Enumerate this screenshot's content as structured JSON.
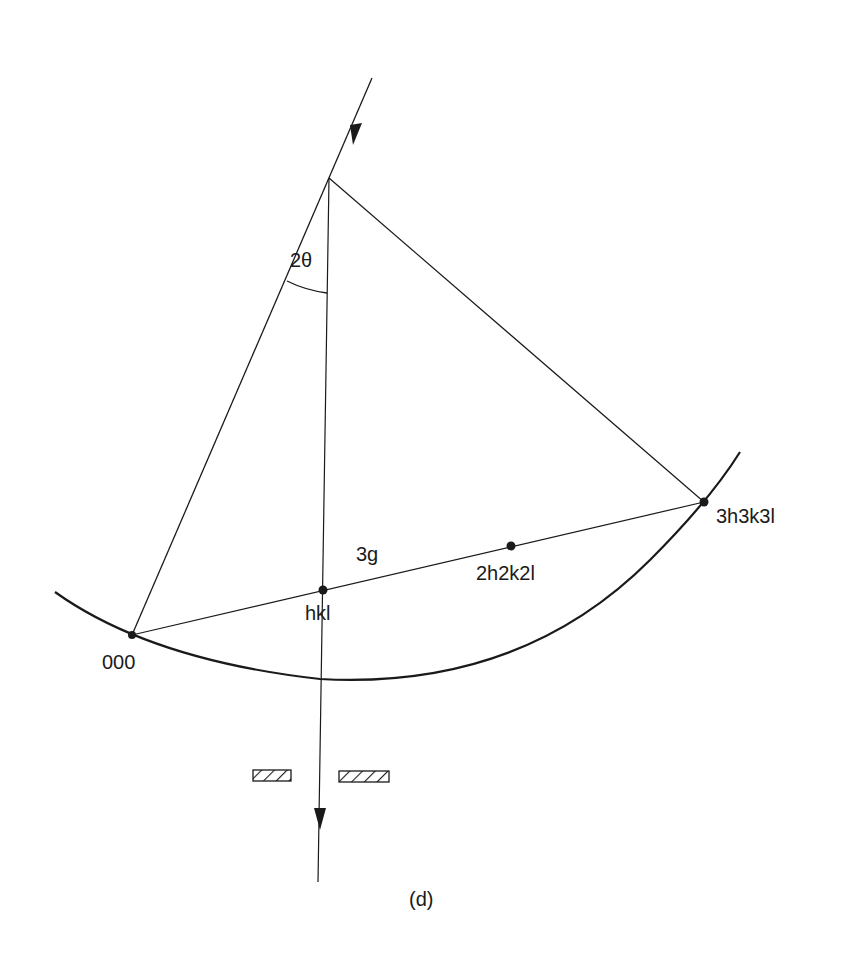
{
  "figure": {
    "caption": "(d)",
    "colors": {
      "ink": "#1a1a1a",
      "background": "#ffffff"
    }
  },
  "labels": {
    "angle": "2θ",
    "origin": "000",
    "first_point": "hkl",
    "second_point": "2h2k2l",
    "third_point": "3h3k3l",
    "vector": "3g"
  },
  "geometry": {
    "source_apex": [
      329,
      178
    ],
    "incident_start": [
      372,
      78
    ],
    "points": {
      "000": [
        132,
        635
      ],
      "hkl": [
        323,
        590
      ],
      "2h2k2l": [
        511,
        546
      ],
      "3h3k3l": [
        704,
        502
      ]
    },
    "ewald_arc": {
      "start": [
        55,
        592
      ],
      "end": [
        740,
        452
      ]
    },
    "transmitted_beam_end": [
      318,
      882
    ],
    "aperture": {
      "y": 772,
      "left_slit": [
        253,
        291
      ],
      "right_slit": [
        339,
        389
      ]
    }
  }
}
